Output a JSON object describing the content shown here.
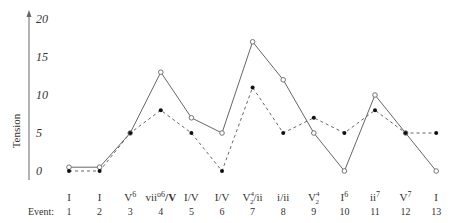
{
  "chart_data": {
    "type": "line",
    "title": "",
    "xlabel": "Event:",
    "ylabel": "Tension",
    "ylim": [
      0,
      20
    ],
    "yticks": [
      0,
      5,
      10,
      15,
      20
    ],
    "grid": false,
    "legend": null,
    "x": [
      1,
      2,
      3,
      4,
      5,
      6,
      7,
      8,
      9,
      10,
      11,
      12,
      13
    ],
    "chord_labels": [
      {
        "base": "I",
        "sup": "",
        "sub": "",
        "tail": ""
      },
      {
        "base": "I",
        "sup": "",
        "sub": "",
        "tail": ""
      },
      {
        "base": "V",
        "sup": "6",
        "sub": "",
        "tail": ""
      },
      {
        "base": "vii",
        "sup": "o6",
        "sub": "",
        "tail": "/V"
      },
      {
        "base": "I/V",
        "sup": "",
        "sub": "",
        "tail": ""
      },
      {
        "base": "I/V",
        "sup": "",
        "sub": "",
        "tail": ""
      },
      {
        "base": "V",
        "sup": "4",
        "sub": "2",
        "tail": "/ii"
      },
      {
        "base": "i/ii",
        "sup": "",
        "sub": "",
        "tail": ""
      },
      {
        "base": "V",
        "sup": "4",
        "sub": "2",
        "tail": ""
      },
      {
        "base": "I",
        "sup": "6",
        "sub": "",
        "tail": ""
      },
      {
        "base": "ii",
        "sup": "7",
        "sub": "",
        "tail": ""
      },
      {
        "base": "V",
        "sup": "7",
        "sub": "",
        "tail": ""
      },
      {
        "base": "I",
        "sup": "",
        "sub": "",
        "tail": ""
      }
    ],
    "series": [
      {
        "name": "solid (open markers)",
        "style": "solid",
        "marker": "open-circle",
        "values": [
          0.5,
          0.5,
          5,
          13,
          7,
          5,
          17,
          12,
          5,
          0,
          10,
          5,
          0
        ]
      },
      {
        "name": "dashed (filled markers)",
        "style": "dashed",
        "marker": "filled-circle",
        "values": [
          0,
          0,
          5,
          8,
          5,
          0,
          11,
          5,
          7,
          5,
          8,
          5,
          5
        ]
      }
    ]
  },
  "colors": {
    "line": "#666666",
    "text": "#333333",
    "marker_fill": "#111111"
  }
}
